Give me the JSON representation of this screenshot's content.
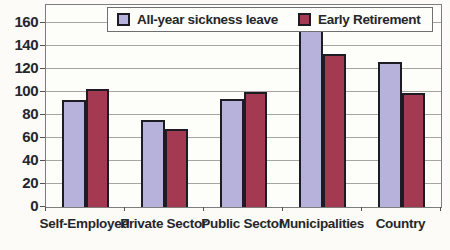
{
  "chart_data": {
    "type": "bar",
    "title": "",
    "xlabel": "",
    "ylabel": "",
    "categories": [
      "Self-Employed",
      "Private Sector",
      "Public Sector",
      "Municipalities",
      "Country"
    ],
    "series": [
      {
        "name": "All-year sickness leave",
        "color": "#b6b2dc",
        "values": [
          93,
          76,
          94,
          158,
          126
        ]
      },
      {
        "name": "Early Retirement",
        "color": "#a33a52",
        "values": [
          103,
          68,
          100,
          133,
          99
        ]
      }
    ],
    "ylim": [
      0,
      176
    ],
    "yticks": [
      0,
      20,
      40,
      60,
      80,
      100,
      120,
      140,
      160
    ],
    "grid": true,
    "legend_position": "top",
    "colors": {
      "bar_border": "#1d1c24",
      "gridline": "#a8a49e",
      "plot_border": "#7d7d7d",
      "background": "#fcfbf7",
      "text": "#26262b"
    }
  }
}
